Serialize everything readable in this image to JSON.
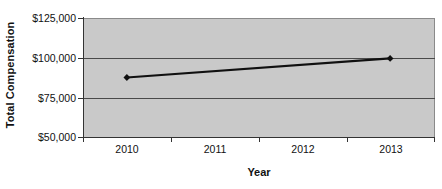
{
  "chart_data": {
    "type": "line",
    "title": "",
    "xlabel": "Year",
    "ylabel": "Total Compensation",
    "categories": [
      "2010",
      "2011",
      "2012",
      "2013"
    ],
    "series": [
      {
        "name": "Total Compensation",
        "values": [
          87500,
          null,
          null,
          99500
        ]
      }
    ],
    "points": [
      {
        "x": "2010",
        "y": 87500
      },
      {
        "x": "2013",
        "y": 99500
      }
    ],
    "ylim": [
      50000,
      125000
    ],
    "ytick_labels": [
      "$125,000",
      "$100,000",
      "$75,000",
      "$50,000"
    ],
    "ytick_values": [
      125000,
      100000,
      75000,
      50000
    ],
    "xtick_labels": [
      "2010",
      "2011",
      "2012",
      "2013"
    ],
    "grid": true,
    "legend": "none",
    "marker": "diamond",
    "colors": {
      "plot_background": "#c9c9c9",
      "page_background": "#ffffff",
      "series_line": "#101010",
      "gridline": "#4a4a4a",
      "axis": "#333333",
      "text": "#111111"
    }
  }
}
